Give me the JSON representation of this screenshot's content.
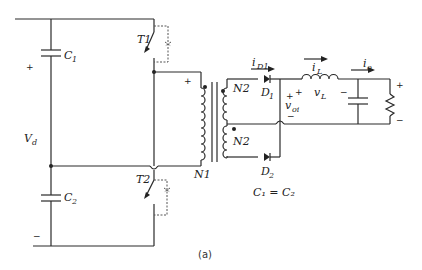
{
  "figure": {
    "caption": "(a)",
    "labels": {
      "C1": "C",
      "C1_sub": "1",
      "C2": "C",
      "C2_sub": "2",
      "Vd": "V",
      "Vd_sub": "d",
      "T1": "T1",
      "T2": "T2",
      "N1": "N1",
      "N2_top": "N2",
      "N2_bottom": "N2",
      "D1": "D",
      "D1_sub": "1",
      "D2": "D",
      "D2_sub": "2",
      "iD1": "i",
      "iD1_sub": "D1",
      "iL": "i",
      "iL_sub": "L",
      "vL": "v",
      "vL_sub": "L",
      "io": "i",
      "io_sub": "o",
      "voi": "v",
      "voi_sub": "oi",
      "equation": "C₁ = C₂",
      "plus": "+",
      "minus": "−"
    }
  }
}
